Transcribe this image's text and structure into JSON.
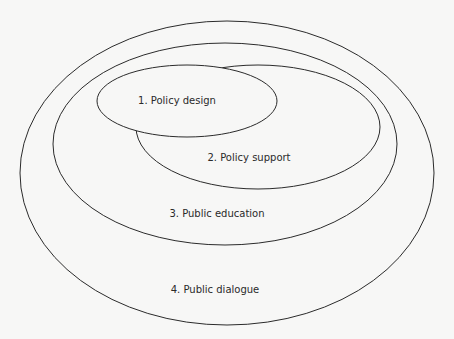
{
  "diagram": {
    "type": "nested-ellipses",
    "layers": [
      {
        "id": 1,
        "label": "1. Policy design"
      },
      {
        "id": 2,
        "label": "2. Policy support"
      },
      {
        "id": 3,
        "label": "3. Public education"
      },
      {
        "id": 4,
        "label": "4. Public dialogue"
      }
    ],
    "colors": {
      "stroke": "#2b2b2b",
      "background": "#f7f7f6"
    }
  }
}
